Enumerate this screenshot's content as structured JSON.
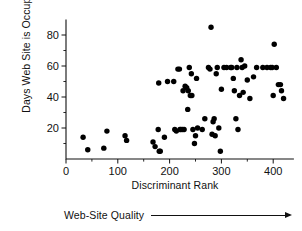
{
  "chart_data": {
    "type": "scatter",
    "title": "",
    "xlabel": "Discriminant Rank",
    "ylabel": "Days Web Site is Occupied",
    "xlim": [
      0,
      440
    ],
    "ylim": [
      0,
      90
    ],
    "xticks": [
      0,
      100,
      200,
      300,
      400
    ],
    "xtick_labels": [
      "0",
      "100",
      "200",
      "300",
      "400"
    ],
    "xticks_minor": [
      50,
      150,
      250,
      350
    ],
    "yticks": [
      20,
      40,
      60,
      80
    ],
    "ytick_labels": [
      "20",
      "40",
      "60",
      "80"
    ],
    "yticks_minor": [
      10,
      30,
      50,
      70
    ],
    "grid": false,
    "legend": null,
    "marker": "filled-circle",
    "marker_color": "#000000",
    "marker_size": 4.2,
    "annotation": {
      "text": "Web-Site Quality",
      "arrow": "right-arrow",
      "position": "below-x-axis"
    },
    "points": [
      {
        "x": 33,
        "y": 14
      },
      {
        "x": 42,
        "y": 6
      },
      {
        "x": 73,
        "y": 7
      },
      {
        "x": 79,
        "y": 18
      },
      {
        "x": 114,
        "y": 15
      },
      {
        "x": 117,
        "y": 12
      },
      {
        "x": 168,
        "y": 11
      },
      {
        "x": 172,
        "y": 8
      },
      {
        "x": 178,
        "y": 19
      },
      {
        "x": 179,
        "y": 49
      },
      {
        "x": 180,
        "y": 5
      },
      {
        "x": 182,
        "y": 5
      },
      {
        "x": 190,
        "y": 14
      },
      {
        "x": 196,
        "y": 50
      },
      {
        "x": 208,
        "y": 50
      },
      {
        "x": 210,
        "y": 19
      },
      {
        "x": 213,
        "y": 18
      },
      {
        "x": 216,
        "y": 58
      },
      {
        "x": 219,
        "y": 58
      },
      {
        "x": 220,
        "y": 19
      },
      {
        "x": 222,
        "y": 19
      },
      {
        "x": 225,
        "y": 19
      },
      {
        "x": 226,
        "y": 44
      },
      {
        "x": 228,
        "y": 19
      },
      {
        "x": 230,
        "y": 47
      },
      {
        "x": 233,
        "y": 46
      },
      {
        "x": 235,
        "y": 32
      },
      {
        "x": 236,
        "y": 44
      },
      {
        "x": 238,
        "y": 59
      },
      {
        "x": 240,
        "y": 41
      },
      {
        "x": 242,
        "y": 55
      },
      {
        "x": 243,
        "y": 41
      },
      {
        "x": 245,
        "y": 19
      },
      {
        "x": 248,
        "y": 10
      },
      {
        "x": 250,
        "y": 15
      },
      {
        "x": 252,
        "y": 52
      },
      {
        "x": 254,
        "y": 20
      },
      {
        "x": 263,
        "y": 19
      },
      {
        "x": 268,
        "y": 26
      },
      {
        "x": 275,
        "y": 59
      },
      {
        "x": 278,
        "y": 58
      },
      {
        "x": 280,
        "y": 85
      },
      {
        "x": 282,
        "y": 16
      },
      {
        "x": 284,
        "y": 24
      },
      {
        "x": 286,
        "y": 26
      },
      {
        "x": 288,
        "y": 15
      },
      {
        "x": 290,
        "y": 55
      },
      {
        "x": 292,
        "y": 59
      },
      {
        "x": 295,
        "y": 20
      },
      {
        "x": 298,
        "y": 5
      },
      {
        "x": 300,
        "y": 45
      },
      {
        "x": 305,
        "y": 59
      },
      {
        "x": 310,
        "y": 59
      },
      {
        "x": 318,
        "y": 59
      },
      {
        "x": 320,
        "y": 59
      },
      {
        "x": 323,
        "y": 52
      },
      {
        "x": 325,
        "y": 44
      },
      {
        "x": 328,
        "y": 26
      },
      {
        "x": 330,
        "y": 59
      },
      {
        "x": 332,
        "y": 19
      },
      {
        "x": 335,
        "y": 41
      },
      {
        "x": 338,
        "y": 64
      },
      {
        "x": 340,
        "y": 59
      },
      {
        "x": 342,
        "y": 43
      },
      {
        "x": 345,
        "y": 60
      },
      {
        "x": 350,
        "y": 51
      },
      {
        "x": 355,
        "y": 39
      },
      {
        "x": 362,
        "y": 53
      },
      {
        "x": 368,
        "y": 59
      },
      {
        "x": 380,
        "y": 59
      },
      {
        "x": 388,
        "y": 59
      },
      {
        "x": 395,
        "y": 59
      },
      {
        "x": 398,
        "y": 59
      },
      {
        "x": 400,
        "y": 41
      },
      {
        "x": 402,
        "y": 74
      },
      {
        "x": 406,
        "y": 59
      },
      {
        "x": 410,
        "y": 48
      },
      {
        "x": 414,
        "y": 48
      },
      {
        "x": 416,
        "y": 44
      },
      {
        "x": 420,
        "y": 39
      }
    ]
  }
}
